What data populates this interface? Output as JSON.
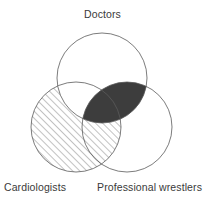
{
  "diagram": {
    "type": "venn-3-set",
    "title": "",
    "canvas": {
      "width": 205,
      "height": 201,
      "background": "#ffffff"
    },
    "stroke": {
      "color": "#5a5a5a",
      "width": 0.8
    },
    "labels": {
      "doctors": "Doctors",
      "cardiologists": "Cardiologists",
      "wrestlers": "Professional wrestlers",
      "color": "#3a3a3a"
    },
    "sets": [
      {
        "key": "doctors",
        "label": "Doctors",
        "cx": 102,
        "cy": 78,
        "r": 45,
        "fill": "none",
        "label_position": "top-center"
      },
      {
        "key": "cardiologists",
        "label": "Cardiologists",
        "cx": 76,
        "cy": 127,
        "r": 45,
        "fill": "diagonal-hatch",
        "label_position": "bottom-left"
      },
      {
        "key": "wrestlers",
        "label": "Professional wrestlers",
        "cx": 127,
        "cy": 127,
        "r": 45,
        "fill": "none",
        "label_position": "bottom-right"
      }
    ],
    "regions": [
      {
        "key": "cardiologists-hatched",
        "description": "Cardiologists circle excluding the Doctors overlap",
        "fill_style": "diagonal-hatch",
        "hatch_color": "#6e6e6e",
        "hatch_angle_deg": 45,
        "hatch_spacing_px": 5
      },
      {
        "key": "doctors-and-wrestlers",
        "description": "Doctors intersect Professional wrestlers",
        "fill_style": "solid",
        "fill_color": "#3d3d3d"
      },
      {
        "key": "doctors-and-cardiologists",
        "description": "Doctors intersect Cardiologists, left unfilled (white)",
        "fill_style": "none",
        "fill_color": "#ffffff"
      }
    ]
  }
}
